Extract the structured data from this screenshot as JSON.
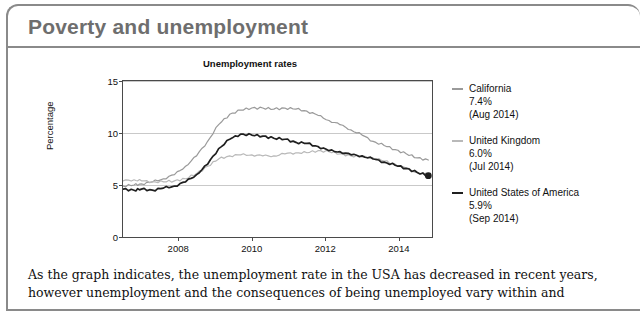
{
  "card": {
    "title": "Poverty and unemployment"
  },
  "chart_data": {
    "type": "line",
    "title": "Unemployment rates",
    "xlabel": "",
    "ylabel": "Percentage",
    "ylim": [
      0,
      15
    ],
    "xlim": [
      2006.5,
      2014.9
    ],
    "yticks": [
      "0",
      "5",
      "10",
      "15"
    ],
    "ytick_values": [
      0,
      5,
      10,
      15
    ],
    "xticks": [
      "2008",
      "2010",
      "2012",
      "2014"
    ],
    "xtick_values": [
      2008,
      2010,
      2012,
      2014
    ],
    "grid": "horizontal",
    "legend_position": "right",
    "series": [
      {
        "name": "California",
        "color": "#9a9a9a",
        "latest_value": "7.4%",
        "latest_date": "(Aug 2014)",
        "x": [
          2006.5,
          2006.8,
          2007.0,
          2007.3,
          2007.6,
          2007.9,
          2008.2,
          2008.5,
          2008.8,
          2009.1,
          2009.4,
          2009.7,
          2010.0,
          2010.3,
          2010.6,
          2010.9,
          2011.2,
          2011.5,
          2011.8,
          2012.1,
          2012.4,
          2012.7,
          2013.0,
          2013.3,
          2013.6,
          2013.9,
          2014.2,
          2014.5,
          2014.8
        ],
        "values": [
          4.9,
          5.0,
          5.1,
          5.3,
          5.6,
          6.0,
          6.8,
          7.8,
          9.2,
          10.8,
          11.8,
          12.2,
          12.4,
          12.4,
          12.3,
          12.4,
          12.3,
          12.1,
          11.7,
          11.2,
          10.8,
          10.3,
          9.8,
          9.2,
          8.8,
          8.4,
          8.0,
          7.6,
          7.4
        ]
      },
      {
        "name": "United Kingdom",
        "color": "#b9b9b9",
        "latest_value": "6.0%",
        "latest_date": "(Jul 2014)",
        "x": [
          2006.5,
          2006.8,
          2007.0,
          2007.3,
          2007.6,
          2007.9,
          2008.2,
          2008.5,
          2008.8,
          2009.1,
          2009.4,
          2009.7,
          2010.0,
          2010.3,
          2010.6,
          2010.9,
          2011.2,
          2011.5,
          2011.8,
          2012.1,
          2012.4,
          2012.7,
          2013.0,
          2013.3,
          2013.6,
          2013.9,
          2014.2,
          2014.5,
          2014.8
        ],
        "values": [
          5.4,
          5.5,
          5.4,
          5.3,
          5.3,
          5.4,
          5.6,
          6.1,
          6.8,
          7.5,
          7.8,
          7.9,
          7.9,
          7.8,
          7.8,
          8.0,
          8.1,
          8.1,
          8.3,
          8.2,
          8.0,
          7.8,
          7.7,
          7.6,
          7.3,
          7.0,
          6.6,
          6.2,
          6.0
        ]
      },
      {
        "name": "United States of America",
        "color": "#1f1f1f",
        "latest_value": "5.9%",
        "latest_date": "(Sep 2014)",
        "marker_at_end": true,
        "x": [
          2006.5,
          2006.8,
          2007.0,
          2007.3,
          2007.6,
          2007.9,
          2008.2,
          2008.5,
          2008.8,
          2009.1,
          2009.4,
          2009.7,
          2010.0,
          2010.3,
          2010.6,
          2010.9,
          2011.2,
          2011.5,
          2011.8,
          2012.1,
          2012.4,
          2012.7,
          2013.0,
          2013.3,
          2013.6,
          2013.9,
          2014.2,
          2014.5,
          2014.8
        ],
        "values": [
          4.6,
          4.5,
          4.6,
          4.5,
          4.7,
          4.9,
          5.3,
          6.0,
          7.0,
          8.5,
          9.4,
          9.9,
          9.8,
          9.7,
          9.5,
          9.4,
          9.1,
          9.0,
          8.7,
          8.3,
          8.2,
          7.9,
          7.8,
          7.5,
          7.2,
          6.9,
          6.6,
          6.2,
          5.9
        ]
      }
    ]
  },
  "body": {
    "line1": "As the graph indicates, the unemployment rate in the USA has decreased in recent years,",
    "line2": "however unemployment and the consequences of being unemployed vary within and"
  }
}
